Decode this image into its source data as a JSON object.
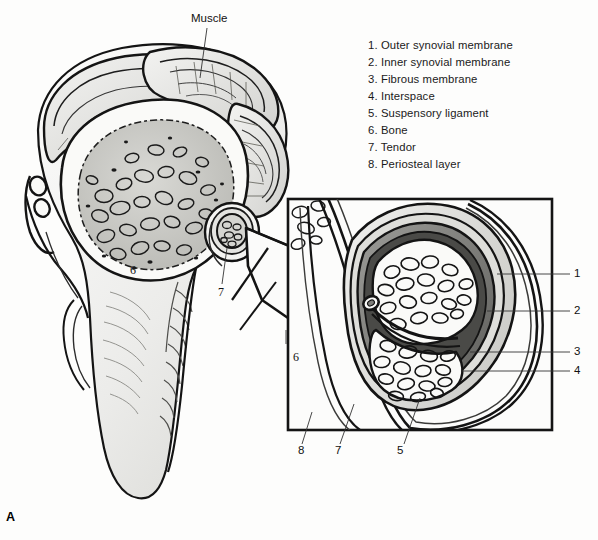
{
  "figure": {
    "panel_letter": "A",
    "muscle_label": "Muscle",
    "background_color": "#fdfdfc",
    "ink_color": "#111111"
  },
  "legend": {
    "items": [
      "1. Outer synovial membrane",
      "2. Inner synovial membrane",
      "3. Fibrous membrane",
      "4. Interspace",
      "5. Suspensory ligament",
      "6. Bone",
      "7. Tendor",
      "8. Periosteal layer"
    ]
  },
  "callouts": {
    "magnified_panel": {
      "right_side": [
        "1",
        "2",
        "3",
        "4"
      ],
      "bottom_side": [
        "8",
        "7",
        "5"
      ]
    },
    "overview": {
      "bone": "6",
      "tendon": "7",
      "bone_lower": "6"
    }
  }
}
